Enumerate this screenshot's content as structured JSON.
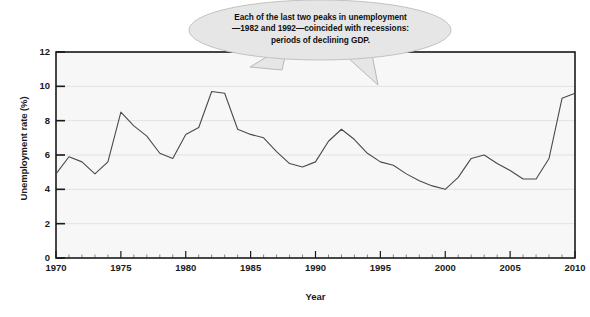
{
  "chart_data": {
    "type": "line",
    "title": "",
    "xlabel": "Year",
    "ylabel": "Unemployment rate (%)",
    "xlim": [
      1970,
      2010
    ],
    "ylim": [
      0,
      12
    ],
    "grid": true,
    "legend": null,
    "y_ticks": [
      0,
      2,
      4,
      6,
      8,
      10,
      12
    ],
    "x_ticks": [
      1970,
      1975,
      1980,
      1985,
      1990,
      1995,
      2000,
      2005,
      2010
    ],
    "x_minor_tick_step": 1,
    "series": [
      {
        "name": "Unemployment rate",
        "color": "#4a4a4a",
        "x": [
          1970,
          1971,
          1972,
          1973,
          1974,
          1975,
          1976,
          1977,
          1978,
          1979,
          1980,
          1981,
          1982,
          1983,
          1984,
          1985,
          1986,
          1987,
          1988,
          1989,
          1990,
          1991,
          1992,
          1993,
          1994,
          1995,
          1996,
          1997,
          1998,
          1999,
          2000,
          2001,
          2002,
          2003,
          2004,
          2005,
          2006,
          2007,
          2008,
          2009,
          2010
        ],
        "values": [
          4.9,
          5.9,
          5.6,
          4.9,
          5.6,
          8.5,
          7.7,
          7.1,
          6.1,
          5.8,
          7.2,
          7.6,
          9.7,
          9.6,
          7.5,
          7.2,
          7.0,
          6.2,
          5.5,
          5.3,
          5.6,
          6.8,
          7.5,
          6.9,
          6.1,
          5.6,
          5.4,
          4.9,
          4.5,
          4.2,
          4.0,
          4.7,
          5.8,
          6.0,
          5.5,
          5.1,
          4.6,
          4.6,
          5.8,
          9.3,
          9.6
        ]
      }
    ],
    "annotations": [
      {
        "name": "recession-callout",
        "text": "Each of the last two peaks in unemployment\n—1982 and 1992—coincided with recessions:\nperiods of declining GDP.",
        "points_to": [
          1982,
          1992
        ]
      }
    ],
    "colors": {
      "plot_background": "#f7f7f7",
      "gridline": "#dcdcdc",
      "axis": "#1a1a1a",
      "line": "#4a4a4a",
      "callout_fill": "#e6e6e6",
      "callout_border": "#b8b8b8"
    }
  }
}
